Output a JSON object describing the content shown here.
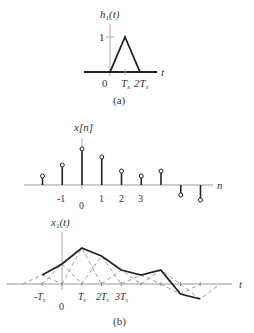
{
  "panel_a": {
    "ylabel_main": "h",
    "ylabel_sub": "1",
    "ylabel_arg": "(t)",
    "xlabel": "t",
    "ytick": "1",
    "xticks": [
      {
        "label": "0",
        "x": 104
      },
      {
        "label": "T",
        "sub": "s",
        "x": 122
      },
      {
        "label": "2T",
        "sub": "s",
        "x": 136
      }
    ],
    "caption": "(a)"
  },
  "panel_xn": {
    "ylabel": "x[n]",
    "xlabel": "n",
    "samples": [
      {
        "n": -2,
        "value": 9
      },
      {
        "n": -1,
        "value": 20
      },
      {
        "n": 0,
        "value": 36
      },
      {
        "n": 1,
        "value": 28
      },
      {
        "n": 2,
        "value": 14
      },
      {
        "n": 3,
        "value": 9
      },
      {
        "n": 4,
        "value": 14
      },
      {
        "n": 5,
        "value": -10
      },
      {
        "n": 6,
        "value": -15
      }
    ],
    "tick_labels": [
      "-1",
      "0",
      "1",
      "2",
      "3"
    ]
  },
  "panel_b": {
    "ylabel_main": "x",
    "ylabel_sub": "1",
    "ylabel_arg": "(t)",
    "xlabel": "t",
    "tick_labels": [
      "-T",
      "0",
      "T",
      "2T",
      "3T"
    ],
    "tick_sub": "s",
    "caption": "(b)"
  },
  "colors": {
    "line": "#222222",
    "axis": "#999999",
    "dashed": "#888888",
    "text": "#333333"
  }
}
